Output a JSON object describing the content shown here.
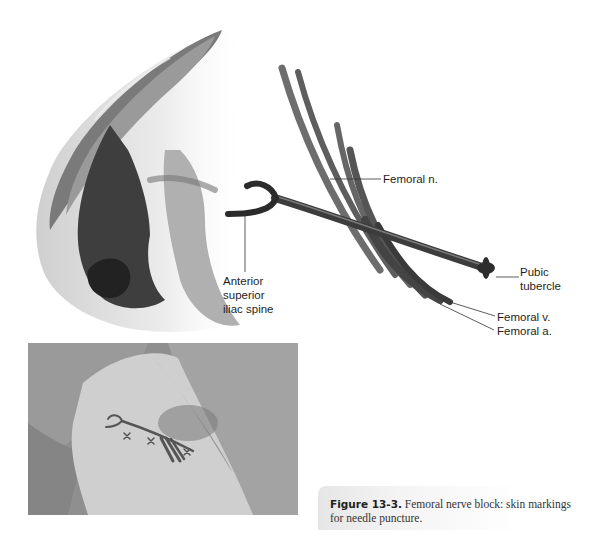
{
  "figure": {
    "illustration": {
      "labels": {
        "femoral_nerve": "Femoral n.",
        "asis": "Anterior\nsuperior\niliac spine",
        "pubic_tubercle": "Pubic\ntubercle",
        "femoral_vein": "Femoral v.",
        "femoral_artery": "Femoral a."
      }
    },
    "photo": {
      "description": "Patient thigh with skin markings for needle puncture"
    },
    "caption": {
      "number": "Figure 13-3.",
      "text": "Femoral nerve block: skin markings for needle puncture."
    }
  }
}
